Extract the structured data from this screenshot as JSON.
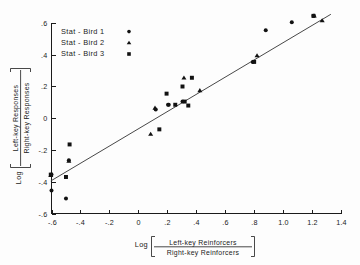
{
  "chart_data": {
    "type": "scatter",
    "title": "",
    "xlabel": "Log [ Left-key Reinforcers / Right-key Reinforcers ]",
    "ylabel": "Log [ Left-key Responses / Right-key Responses ]",
    "xlabel_parts": {
      "log": "Log",
      "numerator": "Left-key  Reinforcers",
      "denominator": "Right-key Reinforcers"
    },
    "ylabel_parts": {
      "log": "Log",
      "numerator": "Left-key  Responses",
      "denominator": "Right-key Responses"
    },
    "xlim": [
      -0.6,
      1.4
    ],
    "ylim": [
      -0.6,
      0.6
    ],
    "xticks": [
      -0.6,
      -0.4,
      -0.2,
      0,
      0.2,
      0.4,
      0.6,
      0.8,
      1.0,
      1.2,
      1.4
    ],
    "xtick_labels": [
      "-.6",
      "-.4",
      "-.2",
      "0",
      ".2",
      ".4",
      ".6",
      ".8",
      "1.0",
      "1.2",
      "1.4"
    ],
    "yticks": [
      -0.6,
      -0.4,
      -0.2,
      0,
      0.2,
      0.4,
      0.6
    ],
    "ytick_labels": [
      "-.6",
      "-.4",
      "-.2",
      "0",
      ".2",
      ".4",
      ".6"
    ],
    "grid": false,
    "legend_position": "top-left",
    "fit_line": {
      "x": [
        -0.605,
        1.33
      ],
      "y": [
        -0.395,
        0.655
      ]
    },
    "series": [
      {
        "name": "Stat - Bird 1",
        "marker": "circle",
        "color": "#121212",
        "points": [
          [
            -0.6,
            -0.355
          ],
          [
            -0.6,
            -0.455
          ],
          [
            -0.5,
            -0.505
          ],
          [
            -0.48,
            -0.265
          ],
          [
            0.12,
            0.055
          ],
          [
            0.21,
            0.085
          ],
          [
            0.205,
            0.085
          ],
          [
            0.305,
            0.105
          ],
          [
            0.79,
            0.355
          ],
          [
            0.88,
            0.555
          ],
          [
            1.06,
            0.605
          ],
          [
            1.21,
            0.645
          ]
        ]
      },
      {
        "name": "Stat - Bird 2",
        "marker": "triangle",
        "color": "#121212",
        "points": [
          [
            -0.605,
            -0.36
          ],
          [
            -0.48,
            -0.27
          ],
          [
            0.085,
            -0.1
          ],
          [
            0.115,
            0.065
          ],
          [
            0.315,
            0.255
          ],
          [
            0.425,
            0.175
          ],
          [
            0.82,
            0.395
          ],
          [
            1.215,
            0.645
          ],
          [
            1.27,
            0.615
          ]
        ]
      },
      {
        "name": "Stat - Bird 3",
        "marker": "square",
        "color": "#121212",
        "points": [
          [
            -0.605,
            -0.355
          ],
          [
            -0.5,
            -0.37
          ],
          [
            -0.475,
            -0.165
          ],
          [
            0.145,
            -0.07
          ],
          [
            0.195,
            0.155
          ],
          [
            0.305,
            0.2
          ],
          [
            0.32,
            0.105
          ],
          [
            0.345,
            0.08
          ],
          [
            0.37,
            0.255
          ],
          [
            0.255,
            0.085
          ],
          [
            0.8,
            0.355
          ],
          [
            1.21,
            0.645
          ]
        ]
      }
    ],
    "legend": [
      {
        "label": "Stat - Bird 1",
        "marker": "circle"
      },
      {
        "label": "Stat - Bird 2",
        "marker": "triangle"
      },
      {
        "label": "Stat - Bird 3",
        "marker": "square"
      }
    ]
  }
}
